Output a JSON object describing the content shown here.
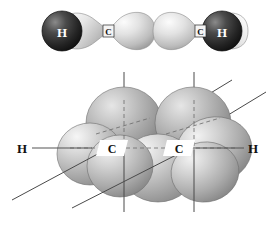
{
  "figure": {
    "name": "acetylene-orbital-diagram",
    "background": "#ffffff",
    "width": 276,
    "height": 230
  },
  "panels": [
    {
      "id": "sigma-framework",
      "caption": "",
      "atoms": [
        {
          "symbol": "H",
          "type": "hydrogen-sphere",
          "cx": 62,
          "cy": 31,
          "r": 20,
          "color": "#2b2b2b",
          "label_color": "#ffffff"
        },
        {
          "symbol": "C",
          "type": "carbon-node",
          "cx": 108,
          "cy": 31,
          "label_color": "#111111"
        },
        {
          "symbol": "C",
          "type": "carbon-node",
          "cx": 200,
          "cy": 31,
          "label_color": "#111111"
        },
        {
          "symbol": "H",
          "type": "hydrogen-sphere",
          "cx": 222,
          "cy": 31,
          "r": 20,
          "color": "#2b2b2b",
          "label_color": "#ffffff"
        }
      ],
      "lobe_color_light": "#f0f0f0",
      "lobe_color_mid": "#b9b9b9",
      "lobe_color_dark": "#8e8e8e"
    },
    {
      "id": "pi-orbitals",
      "caption": "",
      "atoms": [
        {
          "symbol": "H",
          "type": "hydrogen-label",
          "x": 22,
          "y": 151,
          "color": "#111111"
        },
        {
          "symbol": "C",
          "type": "carbon-label",
          "x": 111,
          "y": 151,
          "color": "#111111"
        },
        {
          "symbol": "C",
          "type": "carbon-label",
          "x": 177,
          "y": 151,
          "color": "#111111"
        },
        {
          "symbol": "H",
          "type": "hydrogen-label",
          "x": 252,
          "y": 151,
          "color": "#111111"
        }
      ],
      "lobe_color_light": "#e2e2e2",
      "lobe_color_mid": "#a9a9a9",
      "lobe_color_dark": "#7d7d7d",
      "axis_color": "#4a4a4a",
      "bond_color": "#555555"
    }
  ],
  "labels": {
    "h_left_top": "H",
    "h_right_top": "H",
    "c_left_top": "C",
    "c_right_top": "C",
    "h_left_bottom": "H",
    "h_right_bottom": "H",
    "c_left_bottom": "C",
    "c_right_bottom": "C"
  }
}
